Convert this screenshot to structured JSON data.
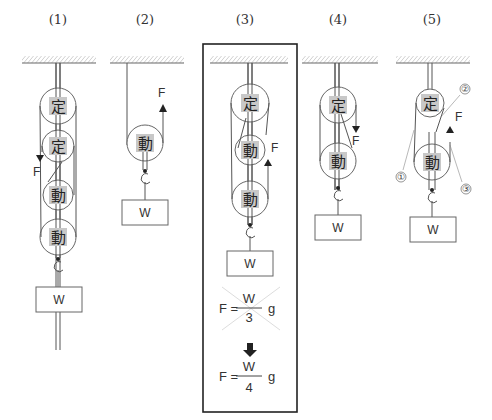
{
  "figure": {
    "panels": [
      {
        "id": "1",
        "label": "(1)",
        "pulleys": [
          "定",
          "定",
          "動",
          "動"
        ],
        "force": "F",
        "force_dir": "down",
        "weight": "W"
      },
      {
        "id": "2",
        "label": "(2)",
        "pulleys": [
          "動"
        ],
        "force": "F",
        "force_dir": "up",
        "weight": "W"
      },
      {
        "id": "3",
        "label": "(3)",
        "pulleys": [
          "定",
          "動",
          "動"
        ],
        "force": "F",
        "force_dir": "up",
        "weight": "W",
        "highlighted": true,
        "equations": {
          "wrong": {
            "lhs": "F =",
            "numerator": "W",
            "denominator": "3",
            "suffix": "g",
            "crossed_out": true
          },
          "arrow": "down-arrow",
          "correct": {
            "lhs": "F =",
            "numerator": "W",
            "denominator": "4",
            "suffix": "g"
          }
        }
      },
      {
        "id": "4",
        "label": "(4)",
        "pulleys": [
          "定",
          "動"
        ],
        "force": "F",
        "force_dir": "down",
        "weight": "W"
      },
      {
        "id": "5",
        "label": "(5)",
        "pulleys": [
          "定",
          "動"
        ],
        "force": "F",
        "force_dir": "up",
        "weight": "W",
        "callouts": [
          "①",
          "②",
          "③"
        ]
      }
    ],
    "kanji_fixed": "定",
    "kanji_moving": "動",
    "colors": {
      "line": "#555555",
      "label_bg": "#c8c8c8",
      "frame": "#222222"
    }
  }
}
